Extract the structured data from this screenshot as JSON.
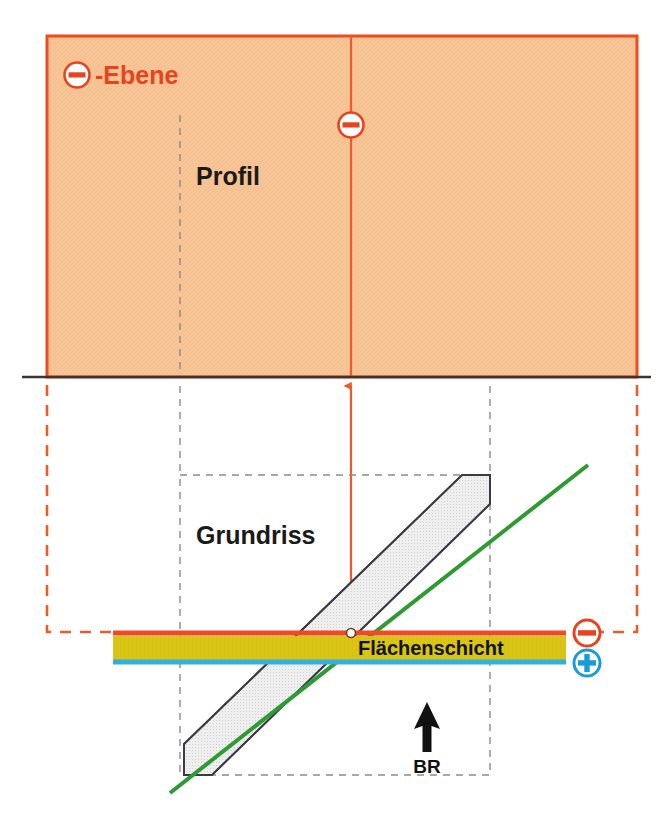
{
  "diagram": {
    "title_label": "⊖ -Ebene",
    "labels": {
      "ebene": "-Ebene",
      "profil": "Profil",
      "grundriss": "Grundriss",
      "flaechenschicht": "Flächenschicht",
      "br": "BR"
    },
    "symbols": {
      "minus_title": "−",
      "minus_profile_axis": "−",
      "minus_layer_right": "−",
      "plus_layer_right": "+"
    },
    "colors": {
      "profile_fill": "#F7C496",
      "profile_border": "#F04A1E",
      "baseline": "#3B3430",
      "red_dashed": "#ED5A2B",
      "red_axis": "#EE5A2C",
      "gray_dashed": "#8C8C8C",
      "band_fill": "#EDEDED",
      "band_stroke": "#3A3A44",
      "green_line": "#2E9B32",
      "layer_top_stripe": "#F04A1E",
      "layer_body": "#D9C515",
      "layer_bottom_stripe": "#33AEE4",
      "minus_circle": "#E8431F",
      "plus_circle": "#1A9CD8",
      "text_dark": "#1a1a1a",
      "background": "#ffffff"
    },
    "geometry": {
      "profile_rect": {
        "x": 47,
        "y": 36,
        "width": 590,
        "height": 341
      },
      "baseline_y": 377,
      "baseline_x1": 22,
      "baseline_x2": 651,
      "vertical_axis_x": 351,
      "layer_band_y": 632,
      "layer_band_x1": 113,
      "layer_band_x2": 566,
      "grundriss_dashed_rect": {
        "x": 180,
        "y": 475,
        "width": 310,
        "height": 300
      }
    }
  }
}
